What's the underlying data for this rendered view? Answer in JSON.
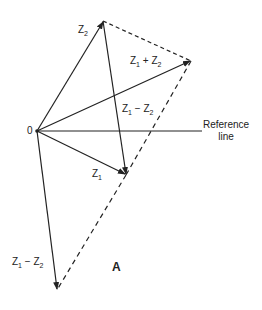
{
  "diagram": {
    "origin_label": "0",
    "reference_line": [
      "Reference",
      "line"
    ],
    "vectors": {
      "z1": {
        "main": "Z",
        "sub": "1"
      },
      "z2": {
        "main": "Z",
        "sub": "2"
      },
      "sum": {
        "a": "Z",
        "a_sub": "1",
        "op": "+",
        "b": "Z",
        "b_sub": "2"
      },
      "diff_upper": {
        "a": "Z",
        "a_sub": "1",
        "op": "−",
        "b": "Z",
        "b_sub": "2"
      },
      "diff_lower": {
        "a": "Z",
        "a_sub": "1",
        "op": "−",
        "b": "Z",
        "b_sub": "2"
      }
    },
    "panel_label": "A"
  }
}
